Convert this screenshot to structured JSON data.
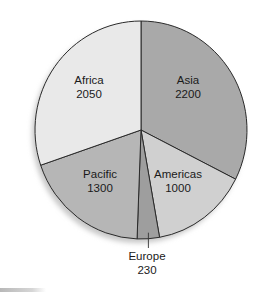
{
  "chart_data": {
    "type": "pie",
    "title": "",
    "categories": [
      "Asia",
      "Americas",
      "Europe",
      "Pacific",
      "Africa"
    ],
    "values": [
      2200,
      1000,
      230,
      1300,
      2050
    ],
    "total": 6780,
    "start_angle_deg": 0,
    "direction": "clockwise from 12 o'clock",
    "slices": [
      {
        "label": "Asia",
        "value": 2200,
        "value_text": "2200",
        "color": "#a9a9a9"
      },
      {
        "label": "Americas",
        "value": 1000,
        "value_text": "1000",
        "color": "#d0d0d0"
      },
      {
        "label": "Europe",
        "value": 230,
        "value_text": "230",
        "color": "#9e9e9e",
        "label_outside": true
      },
      {
        "label": "Pacific",
        "value": 1300,
        "value_text": "1300",
        "color": "#b6b6b6"
      },
      {
        "label": "Africa",
        "value": 2050,
        "value_text": "2050",
        "color": "#e9e9e9"
      }
    ],
    "legend": "none (labels inside slices)",
    "outline_color": "#2a2a2a"
  }
}
